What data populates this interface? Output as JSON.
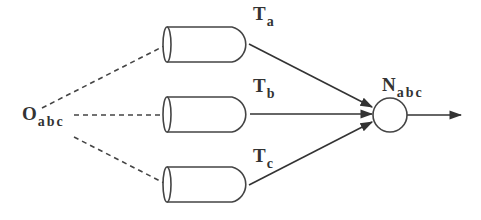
{
  "diagram": {
    "source": {
      "main": "O",
      "sub": "abc"
    },
    "channels": [
      {
        "id": "a",
        "label_main": "T",
        "label_sub": "a"
      },
      {
        "id": "b",
        "label_main": "T",
        "label_sub": "b"
      },
      {
        "id": "c",
        "label_main": "T",
        "label_sub": "c"
      }
    ],
    "node": {
      "main": "N",
      "sub": "abc"
    },
    "colors": {
      "stroke": "#444444",
      "text": "#333333",
      "background": "#ffffff"
    }
  }
}
